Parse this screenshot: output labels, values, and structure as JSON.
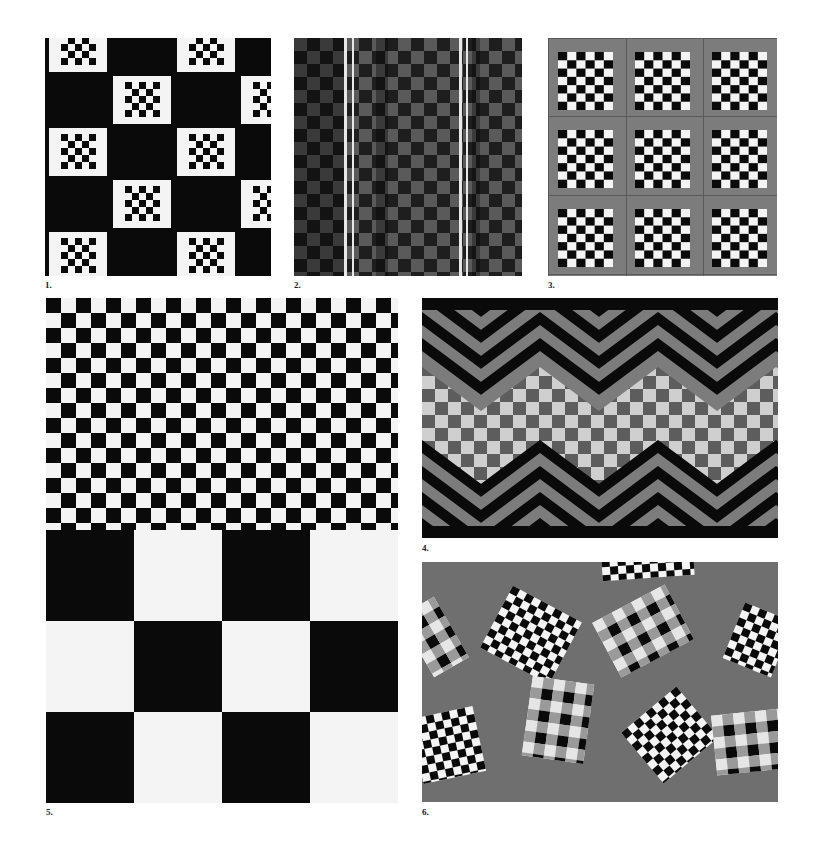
{
  "page": {
    "background": "#ffffff",
    "figures": [
      {
        "id": 1,
        "label": "1.",
        "description": "Black ground with stepped white checker blocks"
      },
      {
        "id": 2,
        "label": "2.",
        "description": "Gray checkerboard with vertical light stripes"
      },
      {
        "id": 3,
        "label": "3.",
        "description": "Gray grid with 3x3 black-and-white checker squares"
      },
      {
        "id": 4,
        "label": "4.",
        "description": "Zigzag chevron border with checkered center band"
      },
      {
        "id": 5,
        "label": "5.",
        "description": "Small checkerboard above large checkerboard"
      },
      {
        "id": 6,
        "label": "6.",
        "description": "Tilted checker and plaid cards on gray ground"
      }
    ]
  },
  "colors": {
    "black": "#0a0a0a",
    "white": "#f4f4f4",
    "gray": "#7c7c7c",
    "mid_gray": "#8e8e8e",
    "light_gray": "#cfcfcf",
    "dark_gray": "#3a3a3a"
  }
}
